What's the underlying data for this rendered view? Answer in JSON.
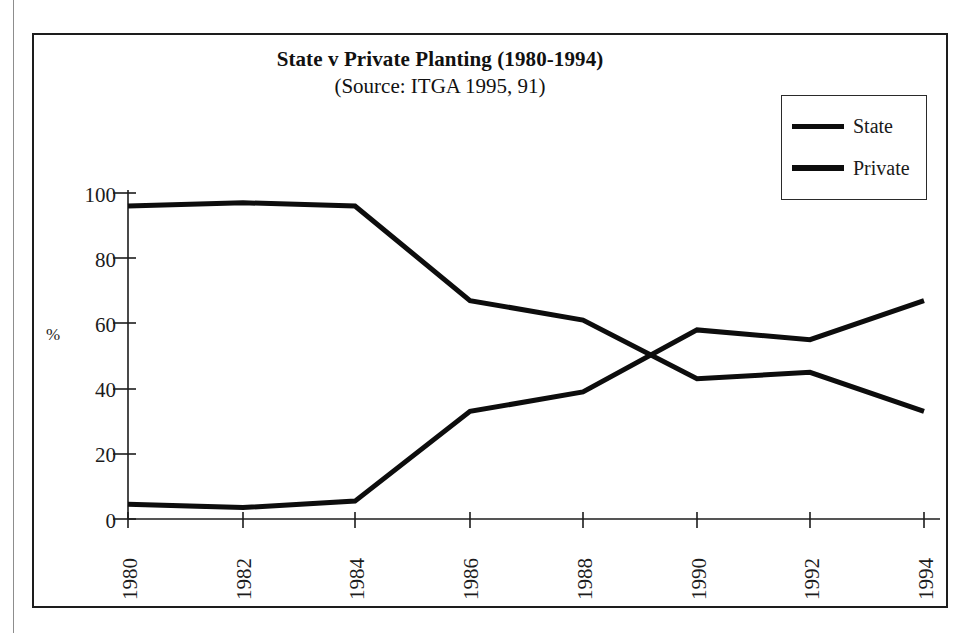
{
  "page": {
    "background": "#ffffff",
    "frame_color": "#1d1d1d"
  },
  "chart_data": {
    "type": "line",
    "title": "State v Private Planting (1980-1994)",
    "subtitle": "(Source: ITGA  1995, 91)",
    "xlabel": "",
    "ylabel": "%",
    "categories": [
      "1980",
      "1982",
      "1984",
      "1986",
      "1988",
      "1990",
      "1992",
      "1994"
    ],
    "x": [
      1980,
      1982,
      1984,
      1986,
      1988,
      1990,
      1992,
      1994
    ],
    "series": [
      {
        "name": "State",
        "color": "#0d0d0d",
        "values": [
          96,
          97,
          96,
          67,
          61,
          43,
          45,
          33
        ]
      },
      {
        "name": "Private",
        "color": "#0d0d0d",
        "values": [
          4.5,
          3.5,
          5.5,
          33,
          39,
          58,
          55,
          67
        ]
      }
    ],
    "ylim": [
      0,
      100
    ],
    "yticks": [
      0,
      20,
      40,
      60,
      80,
      100
    ],
    "ytick_labels": [
      "0",
      "20",
      "40",
      "60",
      "80",
      "100"
    ],
    "grid": false,
    "legend_position": "top-right",
    "legend_entries": [
      "State",
      "Private"
    ],
    "xtick_rotation": -90
  }
}
